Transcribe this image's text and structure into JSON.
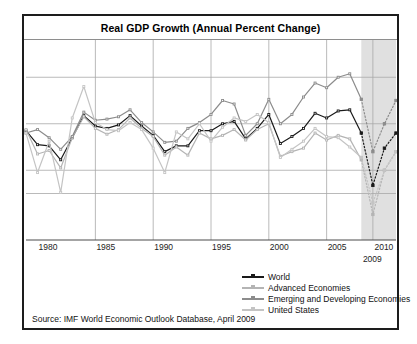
{
  "figure": {
    "title": "Real GDP Growth (Annual Percent Change)",
    "source": "Source:  IMF World Economic Outlook Database, April 2009"
  },
  "legend": {
    "items": [
      {
        "label": "World",
        "color": "#1a1a1a",
        "marker": "square"
      },
      {
        "label": "Advanced Economies",
        "color": "#b4b4b4",
        "marker": "square"
      },
      {
        "label": "Emerging and Developing Economies",
        "color": "#8c8c8c",
        "marker": "square"
      },
      {
        "label": "United States",
        "color": "#c4c4c4",
        "marker": "square"
      }
    ]
  },
  "axis": {
    "x_ticks": [
      "1980",
      "1985",
      "1990",
      "1995",
      "2000",
      "2005",
      "2010"
    ],
    "forecast_marker_label": "2009",
    "y_ticks": []
  },
  "chart_data": {
    "type": "line",
    "title": "Real GDP Growth (Annual Percent Change)",
    "xlabel": "",
    "ylabel": "",
    "xlim": [
      1979,
      2011
    ],
    "ylim": [
      -6,
      10
    ],
    "grid": true,
    "y_gridlines": [
      8,
      4,
      0,
      -2
    ],
    "x_gridlines": [
      1985,
      1990,
      1995,
      2000,
      2005,
      2009
    ],
    "legend_position": "bottom-right",
    "forecast_start": 2008,
    "forecast_shading": {
      "from": 2008,
      "to": 2011,
      "color": "#e0e0e0"
    },
    "x": [
      1979,
      1980,
      1981,
      1982,
      1983,
      1984,
      1985,
      1986,
      1987,
      1988,
      1989,
      1990,
      1991,
      1992,
      1993,
      1994,
      1995,
      1996,
      1997,
      1998,
      1999,
      2000,
      2001,
      2002,
      2003,
      2004,
      2005,
      2006,
      2007,
      2008,
      2009,
      2010,
      2011
    ],
    "series": [
      {
        "name": "World",
        "color": "#1a1a1a",
        "values": [
          3.4,
          2.2,
          2.1,
          0.9,
          2.8,
          4.7,
          3.8,
          3.6,
          3.9,
          4.7,
          3.8,
          3.0,
          1.6,
          2.1,
          2.1,
          3.4,
          3.4,
          4.0,
          4.2,
          2.7,
          3.6,
          4.8,
          2.3,
          2.9,
          3.6,
          4.9,
          4.5,
          5.1,
          5.2,
          3.2,
          -1.3,
          1.9,
          3.2
        ]
      },
      {
        "name": "Advanced Economies",
        "color": "#b4b4b4",
        "values": [
          3.5,
          1.4,
          1.7,
          0.2,
          2.8,
          4.6,
          3.6,
          3.1,
          3.5,
          4.5,
          3.6,
          2.9,
          1.3,
          2.0,
          1.3,
          3.2,
          2.7,
          3.0,
          3.5,
          2.6,
          3.5,
          4.0,
          1.2,
          1.6,
          1.9,
          3.2,
          2.6,
          3.0,
          2.7,
          0.9,
          -3.8,
          0.0,
          1.6
        ]
      },
      {
        "name": "Emerging and Developing Economies",
        "color": "#8c8c8c",
        "values": [
          3.2,
          3.5,
          2.8,
          1.8,
          2.9,
          5.0,
          4.3,
          4.4,
          4.6,
          5.2,
          4.1,
          3.3,
          2.4,
          2.5,
          3.6,
          4.1,
          4.8,
          6.0,
          5.7,
          3.0,
          4.0,
          6.1,
          4.0,
          4.8,
          6.3,
          7.5,
          7.1,
          8.0,
          8.3,
          6.1,
          1.6,
          4.0,
          6.0
        ]
      },
      {
        "name": "United States",
        "color": "#c4c4c4",
        "values": [
          3.2,
          -0.2,
          2.5,
          -1.9,
          4.5,
          7.2,
          4.1,
          3.5,
          3.4,
          4.1,
          3.5,
          1.9,
          -0.2,
          3.3,
          2.7,
          4.0,
          2.5,
          3.7,
          4.5,
          4.2,
          4.8,
          4.1,
          1.1,
          1.8,
          2.5,
          3.6,
          2.9,
          2.8,
          2.0,
          1.1,
          -2.8,
          0.0,
          1.6
        ]
      }
    ]
  }
}
